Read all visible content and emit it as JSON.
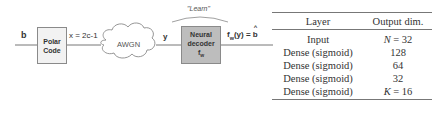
{
  "diagram": {
    "input_label": "b",
    "encoder": {
      "line1": "Polar",
      "line2": "Code"
    },
    "encoder_output_label": "x = 2c-1",
    "channel_label": "AWGN",
    "channel_output_label": "y",
    "learn_label": "\"Learn\"",
    "decoder": {
      "line1": "Neural",
      "line2": "decoder",
      "line3": "f",
      "line3_sub": "w"
    },
    "output_label": {
      "f": "f",
      "sub": "w",
      "rest": "(y) = ",
      "hat": "b"
    },
    "colors": {
      "encoder_fill": "#f2f2f2",
      "decoder_fill": "#bdbdbd",
      "line": "#777777"
    }
  },
  "table": {
    "headers": [
      "Layer",
      "Output dim."
    ],
    "rows": [
      {
        "layer": "Input",
        "dim_var": "N",
        "dim_eq": " = 32"
      },
      {
        "layer": "Dense (sigmoid)",
        "dim_var": "",
        "dim_eq": "128"
      },
      {
        "layer": "Dense (sigmoid)",
        "dim_var": "",
        "dim_eq": "64"
      },
      {
        "layer": "Dense (sigmoid)",
        "dim_var": "",
        "dim_eq": "32"
      },
      {
        "layer": "Dense (sigmoid)",
        "dim_var": "K",
        "dim_eq": " = 16"
      }
    ]
  }
}
